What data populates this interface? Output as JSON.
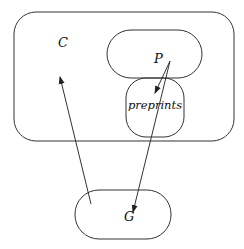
{
  "diagram": {
    "nodes": [
      {
        "id": "C",
        "label": "C",
        "shape": "rounded-rect",
        "x": 14,
        "y": 12,
        "w": 220,
        "h": 129,
        "r": 22,
        "label_x": 58,
        "label_y": 47
      },
      {
        "id": "P",
        "label": "P",
        "shape": "stadium",
        "x": 107,
        "y": 30,
        "w": 95,
        "h": 48,
        "r": 24,
        "label_x": 154,
        "label_y": 63
      },
      {
        "id": "preprints",
        "label": "preprints",
        "shape": "rounded-rect",
        "x": 126,
        "y": 78,
        "w": 58,
        "h": 59,
        "r": 20,
        "label_x": 155,
        "label_y": 109
      },
      {
        "id": "G",
        "label": "G",
        "shape": "stadium",
        "x": 75,
        "y": 190,
        "w": 96,
        "h": 49,
        "r": 24,
        "label_x": 127,
        "label_y": 221
      }
    ],
    "edges": [
      {
        "from": "G",
        "to": "C",
        "x1": 91,
        "y1": 204,
        "x2": 60,
        "y2": 77
      },
      {
        "from": "P",
        "to": "preprints",
        "x1": 170,
        "y1": 61,
        "x2": 155,
        "y2": 93
      },
      {
        "from": "P",
        "to": "G",
        "x1": 170,
        "y1": 61,
        "x2": 133,
        "y2": 212
      }
    ],
    "stroke_color": "#333333",
    "background": "#ffffff"
  }
}
